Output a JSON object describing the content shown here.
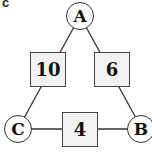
{
  "panel_label": "c",
  "nodes": {
    "A": {
      "label": "A"
    },
    "B": {
      "label": "B"
    },
    "C": {
      "label": "C"
    }
  },
  "edges": {
    "AC": {
      "from": "A",
      "to": "C",
      "weight": "10"
    },
    "AB": {
      "from": "A",
      "to": "B",
      "weight": "6"
    },
    "CB": {
      "from": "C",
      "to": "B",
      "weight": "4"
    }
  },
  "colors": {
    "stroke": "#333333",
    "box_fill": "#f2f2f2",
    "node_fill": "#ffffff"
  }
}
